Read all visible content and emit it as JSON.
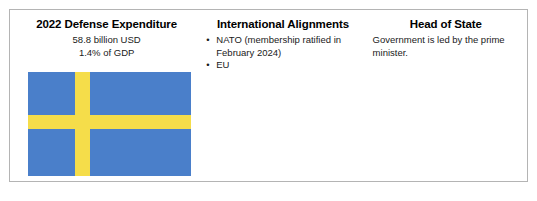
{
  "card": {
    "columns": [
      {
        "name": "defense-expenditure",
        "title": "2022 Defense Expenditure",
        "stats": [
          "58.8 billion USD",
          "1.4% of GDP"
        ],
        "flag": {
          "name": "sweden-flag",
          "field_color": "#4a7fca",
          "cross_color": "#f5dd4a"
        }
      },
      {
        "name": "international-alignments",
        "title": "International Alignments",
        "bullet_glyph": "•",
        "bullets": [
          "NATO (membership ratified in February 2024)",
          "EU"
        ]
      },
      {
        "name": "head-of-state",
        "title": "Head of State",
        "body": "Government is led by the prime minister."
      }
    ]
  }
}
